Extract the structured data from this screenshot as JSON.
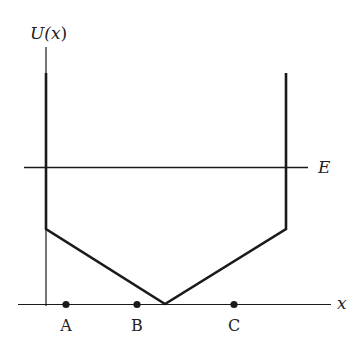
{
  "diagram": {
    "y_axis_label": "U(x)",
    "y_axis_label_parts": {
      "func": "U(",
      "var": "x",
      "close": ")"
    },
    "x_axis_label": "x",
    "energy_label": "E",
    "points": [
      {
        "label": "A",
        "x": 66
      },
      {
        "label": "B",
        "x": 137
      },
      {
        "label": "C",
        "x": 234
      }
    ],
    "colors": {
      "line": "#1a1a1a",
      "background": "#ffffff"
    }
  }
}
